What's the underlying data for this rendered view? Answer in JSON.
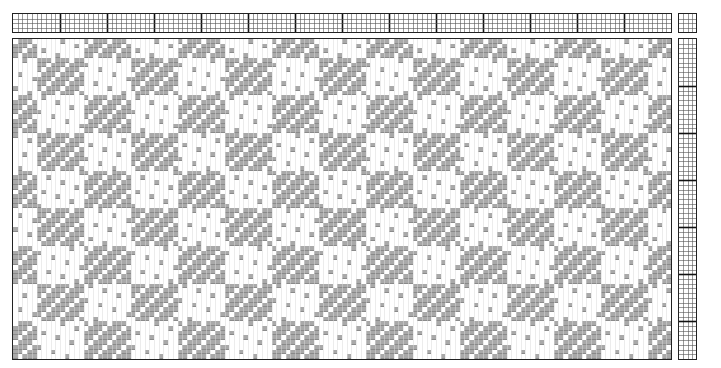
{
  "draft": {
    "cell_px": 4.7,
    "warp_count": 140,
    "pick_count": 68,
    "shafts": 4,
    "treadles": 4,
    "group_every": 10,
    "colors": {
      "grid_line": "#555555",
      "grid_major": "#111111",
      "weft": "#a9a9a9",
      "weft_line": "#8a8a8a",
      "warp": "#ffffff",
      "border": "#222222"
    },
    "pattern_note": "approximated block-weave; the drawdown cells are procedurally generated, not transcribed"
  },
  "regions": {
    "threading": {
      "x": 12,
      "y": 13,
      "w": 660,
      "h": 20
    },
    "tieup": {
      "x": 678,
      "y": 13,
      "w": 19,
      "h": 20
    },
    "drawdown": {
      "x": 12,
      "y": 38,
      "w": 660,
      "h": 322
    },
    "treadling": {
      "x": 678,
      "y": 38,
      "w": 19,
      "h": 322
    }
  }
}
